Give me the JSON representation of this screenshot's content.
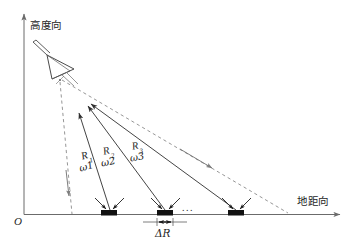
{
  "figure": {
    "title_alt": "SAR imaging geometry: slant ranges to ground targets",
    "background_color": "#ffffff",
    "line_color": "#3a3a3a",
    "axis_color": "#6b6b6b",
    "target_color": "#111111",
    "dash_color": "#8a8a8a"
  },
  "axes": {
    "y_axis_label": "高度向",
    "x_axis_label": "地距向",
    "origin_label": "O"
  },
  "antenna": {
    "name": "radar-antenna",
    "mast_label": "",
    "beam_label": ""
  },
  "ranges": [
    {
      "range_label": "R",
      "range_sub": "1",
      "angle_label": "ω",
      "angle_sub": "1"
    },
    {
      "range_label": "R",
      "range_sub": "2",
      "angle_label": "ω",
      "angle_sub": "2"
    },
    {
      "range_label": "R",
      "range_sub": "3",
      "angle_label": "ω",
      "angle_sub": "3"
    }
  ],
  "targets": {
    "count_visible": 3,
    "ellipsis": "...",
    "spacing_label": "ΔR"
  }
}
